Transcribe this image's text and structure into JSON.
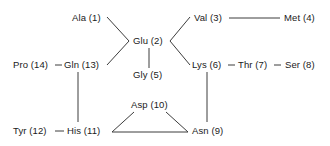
{
  "diagram": {
    "type": "node-link-graph",
    "background_color": "#ffffff",
    "edge_color": "#3d3d3d",
    "text_color": "#1a1a1a",
    "nodes": [
      {
        "id": "ala1",
        "label": "Ala (1)",
        "x": 72,
        "y": 13
      },
      {
        "id": "glu2",
        "label": "Glu (2)",
        "x": 133,
        "y": 36
      },
      {
        "id": "val3",
        "label": "Val (3)",
        "x": 194,
        "y": 13
      },
      {
        "id": "met4",
        "label": "Met (4)",
        "x": 284,
        "y": 13
      },
      {
        "id": "gly5",
        "label": "Gly (5)",
        "x": 133,
        "y": 70
      },
      {
        "id": "lys6",
        "label": "Lys (6)",
        "x": 192,
        "y": 60
      },
      {
        "id": "thr7",
        "label": "Thr (7)",
        "x": 238,
        "y": 60
      },
      {
        "id": "ser8",
        "label": "Ser (8)",
        "x": 285,
        "y": 60
      },
      {
        "id": "asn9",
        "label": "Asn (9)",
        "x": 192,
        "y": 126
      },
      {
        "id": "asp10",
        "label": "Asp (10)",
        "x": 131,
        "y": 100
      },
      {
        "id": "his11",
        "label": "His (11)",
        "x": 67,
        "y": 126
      },
      {
        "id": "tyr12",
        "label": "Tyr (12)",
        "x": 13,
        "y": 126
      },
      {
        "id": "gln13",
        "label": "Gln (13)",
        "x": 64,
        "y": 60
      },
      {
        "id": "pro14",
        "label": "Pro (14)",
        "x": 13,
        "y": 60
      }
    ],
    "edges": [
      {
        "from": "ala1",
        "to": "glu2",
        "name": "edge-ala1-glu2",
        "x1": 107,
        "y1": 17,
        "x2": 129,
        "y2": 41
      },
      {
        "from": "gln13",
        "to": "glu2",
        "name": "edge-gln13-glu2",
        "x1": 107,
        "y1": 65,
        "x2": 129,
        "y2": 41
      },
      {
        "from": "glu2",
        "to": "gly5",
        "name": "edge-glu2-gly5",
        "x1": 149,
        "y1": 48,
        "x2": 149,
        "y2": 68
      },
      {
        "from": "glu2",
        "to": "val3",
        "name": "edge-glu2-val3",
        "x1": 170,
        "y1": 41,
        "x2": 190,
        "y2": 17
      },
      {
        "from": "glu2",
        "to": "lys6",
        "name": "edge-glu2-lys6",
        "x1": 170,
        "y1": 41,
        "x2": 190,
        "y2": 65
      },
      {
        "from": "val3",
        "to": "met4",
        "name": "edge-val3-met4",
        "x1": 229,
        "y1": 18,
        "x2": 280,
        "y2": 18
      },
      {
        "from": "lys6",
        "to": "thr7",
        "name": "edge-lys6-thr7",
        "x1": 228,
        "y1": 65,
        "x2": 235,
        "y2": 65
      },
      {
        "from": "thr7",
        "to": "ser8",
        "name": "edge-thr7-ser8",
        "x1": 274,
        "y1": 65,
        "x2": 281,
        "y2": 65
      },
      {
        "from": "pro14",
        "to": "gln13",
        "name": "edge-pro14-gln13",
        "x1": 55,
        "y1": 65,
        "x2": 62,
        "y2": 65
      },
      {
        "from": "gln13",
        "to": "his11",
        "name": "edge-gln13-his11",
        "x1": 78,
        "y1": 72,
        "x2": 78,
        "y2": 122
      },
      {
        "from": "tyr12",
        "to": "his11",
        "name": "edge-tyr12-his11",
        "x1": 55,
        "y1": 131,
        "x2": 64,
        "y2": 131
      },
      {
        "from": "his11",
        "to": "asp10",
        "name": "edge-his11-asp10",
        "x1": 112,
        "y1": 132,
        "x2": 134,
        "y2": 112
      },
      {
        "from": "asp10",
        "to": "asn9",
        "name": "edge-asp10-asn9",
        "x1": 166,
        "y1": 112,
        "x2": 188,
        "y2": 132
      },
      {
        "from": "his11",
        "to": "asn9",
        "name": "edge-his11-asn9",
        "x1": 112,
        "y1": 132,
        "x2": 188,
        "y2": 132
      },
      {
        "from": "lys6",
        "to": "asn9",
        "name": "edge-lys6-asn9",
        "x1": 207,
        "y1": 72,
        "x2": 207,
        "y2": 122
      }
    ]
  }
}
